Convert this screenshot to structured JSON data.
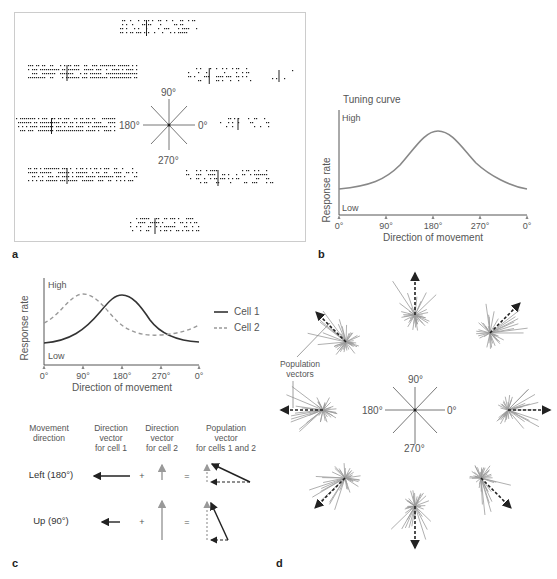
{
  "panels": {
    "a": {
      "letter": "a",
      "compass": {
        "up": "90°",
        "left": "180°",
        "right": "0°",
        "down": "270°"
      }
    },
    "b": {
      "letter": "b",
      "title": "Tuning curve",
      "ylabel": "Response rate",
      "high": "High",
      "low": "Low",
      "xlabel": "Direction of movement",
      "ticks": [
        "0°",
        "90°",
        "180°",
        "270°",
        "0°"
      ]
    },
    "c": {
      "letter": "c",
      "ylabel": "Response rate",
      "high": "High",
      "low": "Low",
      "xlabel": "Direction of movement",
      "ticks": [
        "0°",
        "90°",
        "180°",
        "270°",
        "0°"
      ],
      "legend": [
        "Cell 1",
        "Cell 2"
      ],
      "table_headers": [
        [
          "Movement",
          "direction"
        ],
        [
          "Direction",
          "vector",
          "for cell 1"
        ],
        [
          "Direction",
          "vector",
          "for cell 2"
        ],
        [
          "Population",
          "vector",
          "for cells 1 and 2"
        ]
      ],
      "rows": [
        {
          "label": "Left (180°)",
          "plus": "+",
          "equals": "="
        },
        {
          "label": "Up (90°)",
          "plus": "+",
          "equals": "="
        }
      ]
    },
    "d": {
      "letter": "d",
      "annotation": [
        "Population",
        "vectors"
      ],
      "compass": {
        "up": "90°",
        "left": "180°",
        "right": "0°",
        "down": "270°"
      }
    }
  },
  "chart_data": [
    {
      "type": "line",
      "title": "Tuning curve",
      "xlabel": "Direction of movement",
      "ylabel": "Response rate",
      "categories": [
        "0°",
        "90°",
        "180°",
        "270°",
        "0°"
      ],
      "series": [
        {
          "name": "Cell",
          "values": [
            0.3,
            0.45,
            0.9,
            0.45,
            0.3
          ]
        }
      ],
      "ylim_labels": [
        "Low",
        "High"
      ]
    },
    {
      "type": "line",
      "xlabel": "Direction of movement",
      "ylabel": "Response rate",
      "categories": [
        "0°",
        "90°",
        "180°",
        "270°",
        "0°"
      ],
      "series": [
        {
          "name": "Cell 1",
          "values": [
            0.25,
            0.4,
            0.9,
            0.4,
            0.25
          ]
        },
        {
          "name": "Cell 2",
          "values": [
            0.55,
            0.9,
            0.5,
            0.25,
            0.55
          ]
        }
      ],
      "legend_position": "right"
    }
  ]
}
